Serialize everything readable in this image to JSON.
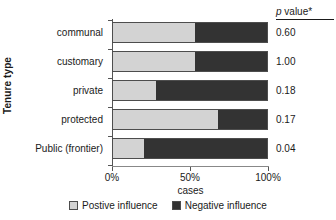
{
  "chart_data": {
    "type": "bar",
    "orientation": "horizontal",
    "stacked": true,
    "normalized": true,
    "title": "",
    "xlabel": "cases",
    "ylabel": "Tenure type",
    "xlim": [
      0,
      100
    ],
    "xticks": [
      0,
      50,
      100
    ],
    "xticklabels": [
      "0%",
      "50%",
      "100%"
    ],
    "grid": false,
    "legend_position": "bottom",
    "categories": [
      "communal",
      "customary",
      "private",
      "protected",
      "Public (frontier)"
    ],
    "series": [
      {
        "name": "Postive influence",
        "color": "#d3d3d3",
        "values": [
          53,
          53,
          28,
          68,
          20
        ]
      },
      {
        "name": "Negative influence",
        "color": "#333333",
        "values": [
          47,
          47,
          72,
          32,
          80
        ]
      }
    ],
    "annotations": {
      "column_header": "p value*",
      "column_header_italic_part": "p",
      "column_header_rest": " value*",
      "values": [
        "0.60",
        "1.00",
        "0.18",
        "0.17",
        "0.04"
      ]
    }
  },
  "axes": {
    "y_title": "Tenure type",
    "x_title": "cases",
    "x_tick_labels": [
      "0%",
      "50%",
      "100%"
    ]
  },
  "rows": [
    {
      "label": "communal",
      "positive": 53,
      "negative": 47,
      "pvalue": "0.60"
    },
    {
      "label": "customary",
      "positive": 53,
      "negative": 47,
      "pvalue": "1.00"
    },
    {
      "label": "private",
      "positive": 28,
      "negative": 72,
      "pvalue": "0.18"
    },
    {
      "label": "protected",
      "positive": 68,
      "negative": 32,
      "pvalue": "0.17"
    },
    {
      "label": "Public (frontier)",
      "positive": 20,
      "negative": 80,
      "pvalue": "0.04"
    }
  ],
  "pvalue_column": {
    "header_italic": "p",
    "header_rest": " value*"
  },
  "legend": {
    "items": [
      {
        "label": "Postive influence",
        "color": "#d3d3d3"
      },
      {
        "label": "Negative influence",
        "color": "#333333"
      }
    ]
  },
  "colors": {
    "positive": "#d3d3d3",
    "negative": "#333333",
    "axis": "#555555",
    "text": "#1a1a1a"
  }
}
